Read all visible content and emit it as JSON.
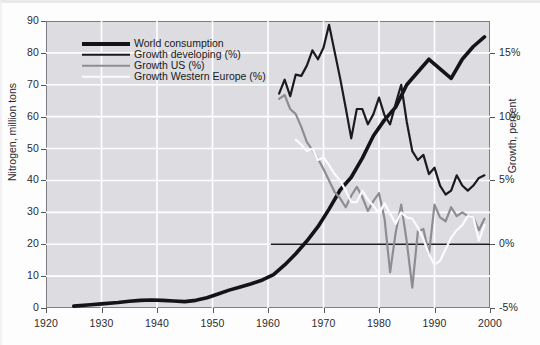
{
  "chart_data": {
    "type": "line",
    "title": "",
    "subtitle": "",
    "xlabel": "",
    "ylabel": "Nitrogen, million tons",
    "ylabel_right": "Growth, percent",
    "xlim": [
      1920,
      2000
    ],
    "ylim": [
      0,
      90
    ],
    "ylim_right": [
      -5,
      17.5
    ],
    "grid": true,
    "grid_color": "#ffffff",
    "plot_background": "#dddde1",
    "legend_position": "upper-left-inside",
    "xticks": [
      1920,
      1930,
      1940,
      1950,
      1960,
      1970,
      1980,
      1990,
      2000
    ],
    "xtick_labels": [
      "1920",
      "1930",
      "1940",
      "1950",
      "1960",
      "1970",
      "1980",
      "1990",
      "2000"
    ],
    "yticks": [
      0,
      10,
      20,
      30,
      40,
      50,
      60,
      70,
      80,
      90
    ],
    "ytick_labels": [
      "0",
      "10",
      "20",
      "30",
      "40",
      "50",
      "60",
      "70",
      "80",
      "90"
    ],
    "yticks_right": [
      -5,
      0,
      5,
      10,
      15
    ],
    "ytick_labels_right": [
      "-5%",
      "0%",
      "5%",
      "10%",
      "15%"
    ],
    "zero_line_percent": 0,
    "series": [
      {
        "name": "World consumption",
        "legend_label": "World consumption",
        "axis": "left",
        "unit": "million tons",
        "color": "#141418",
        "width": 3.6,
        "x": [
          1925,
          1928,
          1930,
          1933,
          1935,
          1937,
          1939,
          1941,
          1943,
          1945,
          1947,
          1949,
          1951,
          1953,
          1955,
          1957,
          1959,
          1961,
          1963,
          1965,
          1967,
          1969,
          1971,
          1973,
          1975,
          1977,
          1979,
          1981,
          1983,
          1985,
          1987,
          1989,
          1991,
          1993,
          1995,
          1997,
          1999
        ],
        "values": [
          0.6,
          1.0,
          1.3,
          1.7,
          2.1,
          2.4,
          2.5,
          2.4,
          2.2,
          2.0,
          2.4,
          3.2,
          4.4,
          5.6,
          6.6,
          7.6,
          8.8,
          10.5,
          13.5,
          17.0,
          21.0,
          25.5,
          31.0,
          37.0,
          41.0,
          47.0,
          54.0,
          59.0,
          63.0,
          70.0,
          74.0,
          78.0,
          75.0,
          72.0,
          78.0,
          82.0,
          85.0
        ]
      },
      {
        "name": "Growth developing (%)",
        "legend_label": "Growth developing (%)",
        "axis": "right",
        "unit": "percent",
        "color": "#1b1b1f",
        "width": 2.2,
        "x": [
          1962,
          1963,
          1964,
          1965,
          1966,
          1967,
          1968,
          1969,
          1970,
          1971,
          1972,
          1973,
          1974,
          1975,
          1976,
          1977,
          1978,
          1979,
          1980,
          1981,
          1982,
          1983,
          1984,
          1985,
          1986,
          1987,
          1988,
          1989,
          1990,
          1991,
          1992,
          1993,
          1994,
          1995,
          1996,
          1997,
          1998,
          1999
        ],
        "values": [
          11.8,
          12.9,
          11.6,
          13.3,
          13.2,
          14.0,
          15.2,
          14.5,
          15.4,
          17.2,
          15.1,
          13.0,
          10.7,
          8.3,
          10.6,
          10.6,
          9.4,
          10.2,
          11.5,
          10.1,
          9.4,
          11.0,
          12.5,
          9.6,
          7.3,
          6.6,
          7.0,
          5.5,
          6.0,
          4.6,
          3.9,
          4.2,
          5.4,
          4.6,
          4.2,
          4.6,
          5.2,
          5.4
        ]
      },
      {
        "name": "Growth US (%)",
        "legend_label": "Growth US (%)",
        "axis": "right",
        "unit": "percent",
        "color": "#8d8d93",
        "width": 2.2,
        "x": [
          1962,
          1963,
          1964,
          1965,
          1966,
          1967,
          1968,
          1969,
          1970,
          1971,
          1972,
          1973,
          1974,
          1975,
          1976,
          1977,
          1978,
          1979,
          1980,
          1981,
          1982,
          1983,
          1984,
          1985,
          1986,
          1987,
          1988,
          1989,
          1990,
          1991,
          1992,
          1993,
          1994,
          1995,
          1996,
          1997,
          1998,
          1999
        ],
        "values": [
          11.4,
          11.7,
          10.6,
          10.2,
          9.2,
          8.0,
          7.4,
          6.7,
          5.9,
          5.0,
          4.1,
          3.6,
          2.9,
          3.8,
          4.5,
          3.7,
          2.6,
          3.4,
          4.0,
          2.0,
          -2.2,
          0.9,
          3.1,
          0.2,
          -3.4,
          1.0,
          1.2,
          -0.8,
          3.1,
          2.1,
          1.8,
          2.9,
          2.2,
          2.5,
          2.2,
          2.1,
          1.1,
          2.0
        ]
      },
      {
        "name": "Growth Western Europe (%)",
        "legend_label": "Growth Western Europe (%)",
        "axis": "right",
        "unit": "percent",
        "color": "#fbfbfb",
        "width": 2.2,
        "x": [
          1965,
          1966,
          1967,
          1968,
          1969,
          1970,
          1971,
          1972,
          1973,
          1974,
          1975,
          1976,
          1977,
          1978,
          1979,
          1980,
          1981,
          1982,
          1983,
          1984,
          1985,
          1986,
          1987,
          1988,
          1989,
          1990,
          1991,
          1992,
          1993,
          1994,
          1995,
          1996,
          1997,
          1998,
          1999
        ],
        "values": [
          8.2,
          7.8,
          7.3,
          7.5,
          6.6,
          6.8,
          6.2,
          5.5,
          5.0,
          4.2,
          3.3,
          3.3,
          4.2,
          3.5,
          3.0,
          2.4,
          3.2,
          2.4,
          1.6,
          2.5,
          2.1,
          2.0,
          1.3,
          0.4,
          -0.8,
          -1.6,
          -1.3,
          -0.4,
          0.5,
          1.1,
          1.5,
          2.2,
          2.1,
          0.3,
          1.5
        ]
      }
    ]
  },
  "legend": {
    "items": [
      {
        "label": "World consumption",
        "color": "#141418",
        "thickness": 4
      },
      {
        "label": "Growth developing (%)",
        "color": "#1b1b1f",
        "thickness": 2.5
      },
      {
        "label": "Growth US (%)",
        "color": "#8d8d93",
        "thickness": 2.5
      },
      {
        "label": "Growth Western Europe (%)",
        "color": "#fbfbfb",
        "thickness": 2.5
      }
    ]
  }
}
